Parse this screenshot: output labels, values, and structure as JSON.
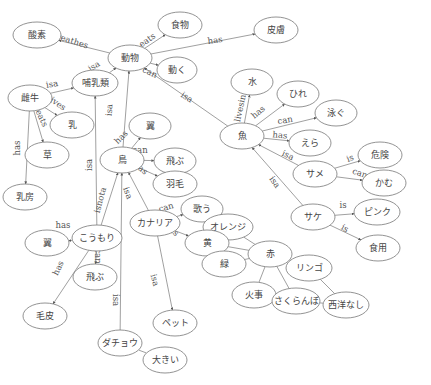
{
  "diagram": {
    "type": "semantic-network",
    "nodes": [
      {
        "id": "n_sanso",
        "label": "酸素",
        "x": 37,
        "y": 35,
        "rx": 24,
        "ry": 13
      },
      {
        "id": "n_shokumotsu",
        "label": "食物",
        "x": 180,
        "y": 25,
        "rx": 22,
        "ry": 13
      },
      {
        "id": "n_hifu",
        "label": "皮膚",
        "x": 276,
        "y": 30,
        "rx": 22,
        "ry": 13
      },
      {
        "id": "n_doubutsu",
        "label": "動物",
        "x": 130,
        "y": 58,
        "rx": 22,
        "ry": 13
      },
      {
        "id": "n_ugoku",
        "label": "動く",
        "x": 177,
        "y": 70,
        "rx": 20,
        "ry": 13
      },
      {
        "id": "n_honyurui",
        "label": "哺乳類",
        "x": 95,
        "y": 83,
        "rx": 23,
        "ry": 13
      },
      {
        "id": "n_meushi",
        "label": "雌牛",
        "x": 30,
        "y": 98,
        "rx": 22,
        "ry": 13
      },
      {
        "id": "n_chichi",
        "label": "乳",
        "x": 72,
        "y": 125,
        "rx": 22,
        "ry": 13
      },
      {
        "id": "n_kusa",
        "label": "草",
        "x": 47,
        "y": 155,
        "rx": 22,
        "ry": 13
      },
      {
        "id": "n_mizu",
        "label": "水",
        "x": 252,
        "y": 82,
        "rx": 21,
        "ry": 13
      },
      {
        "id": "n_hire",
        "label": "ひれ",
        "x": 298,
        "y": 94,
        "rx": 21,
        "ry": 13
      },
      {
        "id": "n_oyogu",
        "label": "泳ぐ",
        "x": 336,
        "y": 113,
        "rx": 21,
        "ry": 13
      },
      {
        "id": "n_sakana",
        "label": "魚",
        "x": 242,
        "y": 136,
        "rx": 22,
        "ry": 13
      },
      {
        "id": "n_era",
        "label": "えら",
        "x": 310,
        "y": 143,
        "rx": 21,
        "ry": 13
      },
      {
        "id": "n_tsubasa1",
        "label": "翼",
        "x": 150,
        "y": 126,
        "rx": 21,
        "ry": 13
      },
      {
        "id": "n_tori",
        "label": "鳥",
        "x": 122,
        "y": 160,
        "rx": 22,
        "ry": 13
      },
      {
        "id": "n_tobu1",
        "label": "飛ぶ",
        "x": 175,
        "y": 161,
        "rx": 21,
        "ry": 13
      },
      {
        "id": "n_umou",
        "label": "羽毛",
        "x": 175,
        "y": 184,
        "rx": 22,
        "ry": 13
      },
      {
        "id": "n_kiken",
        "label": "危険",
        "x": 380,
        "y": 155,
        "rx": 22,
        "ry": 13
      },
      {
        "id": "n_same",
        "label": "サメ",
        "x": 315,
        "y": 174,
        "rx": 22,
        "ry": 13
      },
      {
        "id": "n_kamu",
        "label": "かむ",
        "x": 384,
        "y": 183,
        "rx": 22,
        "ry": 13
      },
      {
        "id": "n_chibusa",
        "label": "乳房",
        "x": 25,
        "y": 197,
        "rx": 22,
        "ry": 13
      },
      {
        "id": "n_utau",
        "label": "歌う",
        "x": 202,
        "y": 209,
        "rx": 21,
        "ry": 13
      },
      {
        "id": "n_kanaria",
        "label": "カナリア",
        "x": 155,
        "y": 223,
        "rx": 25,
        "ry": 13
      },
      {
        "id": "n_koumori",
        "label": "こうもり",
        "x": 97,
        "y": 238,
        "rx": 25,
        "ry": 13
      },
      {
        "id": "n_orenji",
        "label": "オレンジ",
        "x": 228,
        "y": 227,
        "rx": 25,
        "ry": 13
      },
      {
        "id": "n_sake",
        "label": "サケ",
        "x": 313,
        "y": 217,
        "rx": 22,
        "ry": 13
      },
      {
        "id": "n_pinku",
        "label": "ピンク",
        "x": 377,
        "y": 212,
        "rx": 23,
        "ry": 13
      },
      {
        "id": "n_ki",
        "label": "黄",
        "x": 207,
        "y": 243,
        "rx": 22,
        "ry": 13
      },
      {
        "id": "n_tsubasa2",
        "label": "翼",
        "x": 47,
        "y": 243,
        "rx": 22,
        "ry": 13
      },
      {
        "id": "n_aka",
        "label": "赤",
        "x": 270,
        "y": 254,
        "rx": 22,
        "ry": 13
      },
      {
        "id": "n_shokuyou",
        "label": "食用",
        "x": 378,
        "y": 248,
        "rx": 22,
        "ry": 13
      },
      {
        "id": "n_midori",
        "label": "緑",
        "x": 224,
        "y": 264,
        "rx": 22,
        "ry": 13
      },
      {
        "id": "n_ringo",
        "label": "リンゴ",
        "x": 309,
        "y": 268,
        "rx": 23,
        "ry": 13
      },
      {
        "id": "n_tobu2",
        "label": "飛ぶ",
        "x": 95,
        "y": 277,
        "rx": 22,
        "ry": 13
      },
      {
        "id": "n_kegawa",
        "label": "毛皮",
        "x": 45,
        "y": 316,
        "rx": 22,
        "ry": 13
      },
      {
        "id": "n_kaji",
        "label": "火事",
        "x": 254,
        "y": 295,
        "rx": 22,
        "ry": 13
      },
      {
        "id": "n_sakuranbo",
        "label": "さくらんぼ",
        "x": 296,
        "y": 301,
        "rx": 24,
        "ry": 13
      },
      {
        "id": "n_seiyounashi",
        "label": "西洋なし",
        "x": 346,
        "y": 305,
        "rx": 23,
        "ry": 13
      },
      {
        "id": "n_petto",
        "label": "ペット",
        "x": 175,
        "y": 323,
        "rx": 22,
        "ry": 13
      },
      {
        "id": "n_dachou",
        "label": "ダチョウ",
        "x": 120,
        "y": 343,
        "rx": 22,
        "ry": 13
      },
      {
        "id": "n_ookii",
        "label": "大きい",
        "x": 165,
        "y": 360,
        "rx": 22,
        "ry": 13
      }
    ],
    "edges": [
      {
        "from": "n_doubutsu",
        "to": "n_sanso",
        "label": "breathes",
        "arrow": true,
        "lx": 70,
        "ly": 40,
        "rot": 18
      },
      {
        "from": "n_doubutsu",
        "to": "n_shokumotsu",
        "label": "eats",
        "arrow": true,
        "lx": 147,
        "ly": 40,
        "rot": -35
      },
      {
        "from": "n_doubutsu",
        "to": "n_hifu",
        "label": "has",
        "arrow": true,
        "lx": 215,
        "ly": 40,
        "rot": -8
      },
      {
        "from": "n_doubutsu",
        "to": "n_ugoku",
        "label": "can",
        "arrow": true,
        "lx": 150,
        "ly": 72,
        "rot": 25
      },
      {
        "from": "n_honyurui",
        "to": "n_doubutsu",
        "label": "isa",
        "arrow": true,
        "lx": 94,
        "ly": 66,
        "rot": -30
      },
      {
        "from": "n_sakana",
        "to": "n_doubutsu",
        "label": "isa",
        "arrow": true,
        "lx": 187,
        "ly": 97,
        "rot": 33
      },
      {
        "from": "n_meushi",
        "to": "n_honyurui",
        "label": "isa",
        "arrow": true,
        "lx": 52,
        "ly": 84,
        "rot": -10
      },
      {
        "from": "n_meushi",
        "to": "n_chichi",
        "label": "gives",
        "arrow": true,
        "lx": 56,
        "ly": 102,
        "rot": 35
      },
      {
        "from": "n_meushi",
        "to": "n_kusa",
        "label": "eats",
        "arrow": true,
        "lx": 42,
        "ly": 118,
        "rot": 65
      },
      {
        "from": "n_meushi",
        "to": "n_chibusa",
        "label": "has",
        "arrow": true,
        "lx": 17,
        "ly": 148,
        "rot": -90
      },
      {
        "from": "n_koumori",
        "to": "n_honyurui",
        "label": "isa",
        "arrow": true,
        "lx": 89,
        "ly": 165,
        "rot": -90
      },
      {
        "from": "n_tori",
        "to": "n_doubutsu",
        "label": "isa",
        "arrow": true,
        "lx": 109,
        "ly": 110,
        "rot": -85
      },
      {
        "from": "n_sakana",
        "to": "n_mizu",
        "label": "livesin",
        "arrow": true,
        "lx": 240,
        "ly": 108,
        "rot": -78
      },
      {
        "from": "n_sakana",
        "to": "n_hire",
        "label": "has",
        "arrow": true,
        "lx": 258,
        "ly": 112,
        "rot": -40
      },
      {
        "from": "n_sakana",
        "to": "n_oyogu",
        "label": "can",
        "arrow": true,
        "lx": 285,
        "ly": 120,
        "rot": -10
      },
      {
        "from": "n_sakana",
        "to": "n_era",
        "label": "has",
        "arrow": true,
        "lx": 280,
        "ly": 135,
        "rot": 5
      },
      {
        "from": "n_same",
        "to": "n_sakana",
        "label": "isa",
        "arrow": true,
        "lx": 288,
        "ly": 155,
        "rot": 25
      },
      {
        "from": "n_same",
        "to": "n_kiken",
        "label": "is",
        "arrow": true,
        "lx": 350,
        "ly": 158,
        "rot": -20
      },
      {
        "from": "n_same",
        "to": "n_kamu",
        "label": "can",
        "arrow": true,
        "lx": 360,
        "ly": 173,
        "rot": 20
      },
      {
        "from": "n_sake",
        "to": "n_sakana",
        "label": "isa",
        "arrow": true,
        "lx": 275,
        "ly": 182,
        "rot": 55
      },
      {
        "from": "n_sake",
        "to": "n_pinku",
        "label": "is",
        "arrow": true,
        "lx": 343,
        "ly": 205,
        "rot": 0
      },
      {
        "from": "n_sake",
        "to": "n_shokuyou",
        "label": "is",
        "arrow": true,
        "lx": 345,
        "ly": 228,
        "rot": 30
      },
      {
        "from": "n_tori",
        "to": "n_tsubasa1",
        "label": "has",
        "arrow": true,
        "lx": 121,
        "ly": 137,
        "rot": -45
      },
      {
        "from": "n_tori",
        "to": "n_tobu1",
        "label": "can",
        "arrow": true,
        "lx": 140,
        "ly": 150,
        "rot": 0
      },
      {
        "from": "n_tori",
        "to": "n_umou",
        "label": "has",
        "arrow": true,
        "lx": 141,
        "ly": 168,
        "rot": 40
      },
      {
        "from": "n_koumori",
        "to": "n_tori",
        "label": "isnota",
        "arrow": true,
        "lx": 100,
        "ly": 200,
        "rot": -75
      },
      {
        "from": "n_kanaria",
        "to": "n_tori",
        "label": "isa",
        "arrow": true,
        "lx": 128,
        "ly": 193,
        "rot": 70
      },
      {
        "from": "n_dachou",
        "to": "n_tori",
        "label": "isa",
        "arrow": true,
        "lx": 116,
        "ly": 300,
        "rot": 90
      },
      {
        "from": "n_kanaria",
        "to": "n_utau",
        "label": "can",
        "arrow": true,
        "lx": 166,
        "ly": 207,
        "rot": -15
      },
      {
        "from": "n_kanaria",
        "to": "n_ki",
        "label": "is",
        "arrow": true,
        "lx": 175,
        "ly": 232,
        "rot": 40
      },
      {
        "from": "n_kanaria",
        "to": "n_petto",
        "label": "isa",
        "arrow": true,
        "lx": 155,
        "ly": 280,
        "rot": 75
      },
      {
        "from": "n_koumori",
        "to": "n_tsubasa2",
        "label": "has",
        "arrow": true,
        "lx": 63,
        "ly": 225,
        "rot": 0
      },
      {
        "from": "n_koumori",
        "to": "n_tobu2",
        "label": "can",
        "arrow": true,
        "lx": 98,
        "ly": 256,
        "rot": 90
      },
      {
        "from": "n_koumori",
        "to": "n_kegawa",
        "label": "has",
        "arrow": true,
        "lx": 58,
        "ly": 268,
        "rot": -65
      },
      {
        "from": "n_ki",
        "to": "n_aka",
        "label": "",
        "arrow": false
      },
      {
        "from": "n_ki",
        "to": "n_midori",
        "label": "",
        "arrow": false
      },
      {
        "from": "n_orenji",
        "to": "n_aka",
        "label": "",
        "arrow": false
      },
      {
        "from": "n_aka",
        "to": "n_midori",
        "label": "",
        "arrow": false
      },
      {
        "from": "n_aka",
        "to": "n_ringo",
        "label": "",
        "arrow": false
      },
      {
        "from": "n_aka",
        "to": "n_kaji",
        "label": "",
        "arrow": false
      },
      {
        "from": "n_aka",
        "to": "n_sakuranbo",
        "label": "",
        "arrow": false
      },
      {
        "from": "n_ringo",
        "to": "n_seiyounashi",
        "label": "",
        "arrow": false
      },
      {
        "from": "n_sakuranbo",
        "to": "n_seiyounashi",
        "label": "",
        "arrow": false
      },
      {
        "from": "n_dachou",
        "to": "n_ookii",
        "label": "",
        "arrow": false
      }
    ]
  }
}
